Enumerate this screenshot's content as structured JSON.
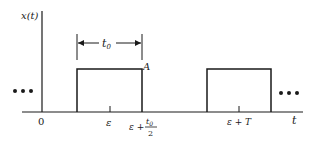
{
  "diagram": {
    "y_axis_label": "x(t)",
    "x_axis_label": "t",
    "amplitude_label": "A",
    "width_label": "t",
    "width_label_sub": "0",
    "ticks": [
      {
        "label": "0"
      },
      {
        "label": "ε"
      },
      {
        "label_main": "ε +",
        "label_num": "t",
        "label_num_sub": "0",
        "label_den": "2"
      },
      {
        "label": "ε + T"
      }
    ],
    "ellipsis": "•••",
    "colors": {
      "stroke": "#1a1a1a",
      "background": "#ffffff"
    }
  }
}
